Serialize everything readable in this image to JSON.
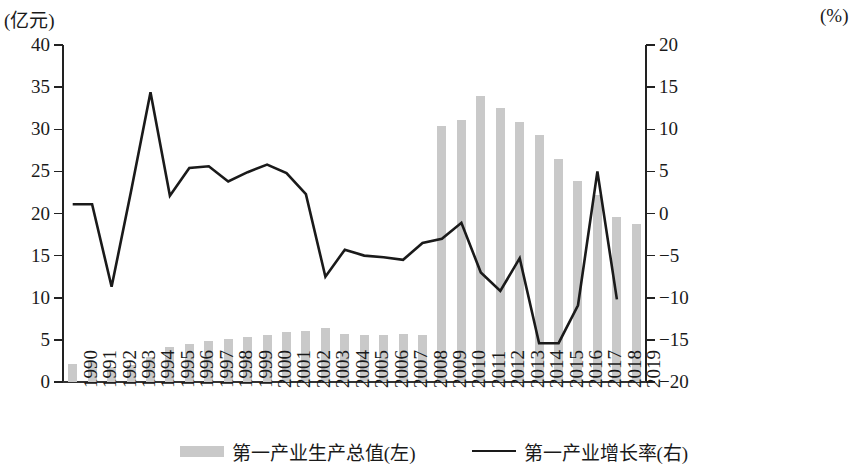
{
  "chart_data": {
    "type": "bar",
    "title": "",
    "subtitle": "",
    "xlabel": "",
    "ylabel": "(亿元)",
    "y2label": "(%)",
    "ylim": [
      0,
      40
    ],
    "y2lim": [
      -20,
      20
    ],
    "ytick_step": 5,
    "y2tick_step": 5,
    "yticks": [
      "0",
      "5",
      "10",
      "15",
      "20",
      "25",
      "30",
      "35",
      "40"
    ],
    "y2ticks": [
      "−20",
      "−15",
      "−10",
      "−5",
      "0",
      "5",
      "10",
      "15",
      "20"
    ],
    "grid": false,
    "legend_position": "bottom",
    "categories": [
      "1990",
      "1991",
      "1992",
      "1993",
      "1994",
      "1995",
      "1996",
      "1997",
      "1998",
      "1999",
      "2000",
      "2001",
      "2002",
      "2003",
      "2004",
      "2005",
      "2006",
      "2007",
      "2008",
      "2009",
      "2010",
      "2011",
      "2012",
      "2013",
      "2014",
      "2015",
      "2016",
      "2017",
      "2018",
      "2019"
    ],
    "series": [
      {
        "name": "第一产业生产总值(左)",
        "type": "bar",
        "axis": "left",
        "unit": "亿元",
        "color": "#c9c9c9",
        "values": [
          2.1,
          2.4,
          1.8,
          2.0,
          3.0,
          4.1,
          4.5,
          4.9,
          5.1,
          5.3,
          5.6,
          5.9,
          6.1,
          6.4,
          5.7,
          5.6,
          5.6,
          5.7,
          5.6,
          30.4,
          31.1,
          34.0,
          32.5,
          30.9,
          29.3,
          26.5,
          23.9,
          22.2,
          19.6,
          18.8
        ]
      },
      {
        "name": "第一产业增长率(右)",
        "type": "line",
        "axis": "right",
        "unit": "%",
        "color": "#1a1a1a",
        "values": [
          1.1,
          1.1,
          -8.7,
          2.6,
          14.4,
          2.1,
          5.4,
          5.6,
          3.8,
          4.9,
          5.8,
          4.8,
          2.3,
          -7.5,
          -4.3,
          -5.0,
          -5.2,
          -5.5,
          -3.5,
          -3.0,
          -1.1,
          -7.0,
          -9.2,
          -5.3,
          -15.4,
          -15.4,
          -10.9,
          5.0,
          -10.2,
          null
        ]
      }
    ]
  },
  "legend": {
    "items": [
      {
        "label": "第一产业生产总值(左)",
        "marker": "bar-swatch"
      },
      {
        "label": "第一产业增长率(右)",
        "marker": "line-swatch"
      }
    ]
  },
  "axes": {
    "left_unit": "(亿元)",
    "right_unit": "(%)"
  }
}
